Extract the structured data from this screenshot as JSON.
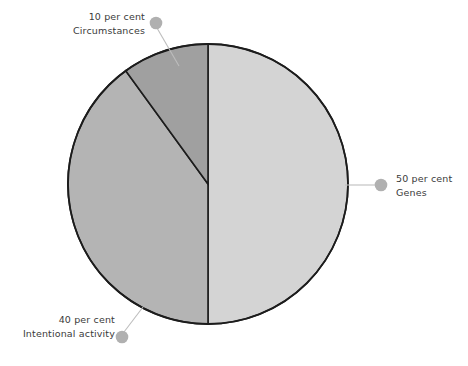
{
  "chart_data": {
    "type": "pie",
    "title": "",
    "subtitle": "",
    "xlabel": "",
    "ylabel": "",
    "legend_position": "callout-labels",
    "grid": false,
    "unit": "per cent",
    "categories": [
      "Genes",
      "Intentional activity",
      "Circumstances"
    ],
    "values": [
      50,
      40,
      10
    ],
    "slices": [
      {
        "name": "Genes",
        "value": 50,
        "value_label": "50 per cent",
        "color": "#d4d4d4",
        "start_angle_deg": 0,
        "end_angle_deg": 180
      },
      {
        "name": "Intentional activity",
        "value": 40,
        "value_label": "40 per cent",
        "color": "#b4b4b4",
        "start_angle_deg": 180,
        "end_angle_deg": 324
      },
      {
        "name": "Circumstances",
        "value": 10,
        "value_label": "10 per cent",
        "color": "#a0a0a0",
        "start_angle_deg": 324,
        "end_angle_deg": 360
      }
    ]
  },
  "figure": {
    "background_color": "#ffffff",
    "outline_color": "#1c1c1c",
    "leader_line_color": "#b9b9b9",
    "leader_dot_color": "#b0b0b0",
    "text_color": "#3a3a3a"
  },
  "callouts": {
    "circumstances": {
      "value": "10 per cent",
      "name": "Circumstances"
    },
    "genes": {
      "value": "50 per cent",
      "name": "Genes"
    },
    "intentional": {
      "value": "40 per cent",
      "name": "Intentional activity"
    }
  }
}
